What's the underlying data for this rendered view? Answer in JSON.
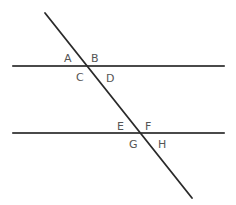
{
  "diagram": {
    "colors": {
      "stroke": "#2a2a2a",
      "label": "#555555",
      "background": "#ffffff"
    },
    "parallel_lines": [
      {
        "name": "upper-parallel-line",
        "x1": 13,
        "y1": 66,
        "x2": 224,
        "y2": 66
      },
      {
        "name": "lower-parallel-line",
        "x1": 13,
        "y1": 133,
        "x2": 224,
        "y2": 133
      }
    ],
    "transversal": {
      "x1": 45,
      "y1": 13,
      "x2": 192,
      "y2": 198
    },
    "intersections": [
      {
        "x": 88,
        "y": 66
      },
      {
        "x": 142,
        "y": 133
      }
    ],
    "angle_labels": [
      {
        "text": "A",
        "x": 64,
        "y": 62
      },
      {
        "text": "B",
        "x": 91,
        "y": 62
      },
      {
        "text": "C",
        "x": 76,
        "y": 81
      },
      {
        "text": "D",
        "x": 106,
        "y": 82
      },
      {
        "text": "E",
        "x": 117,
        "y": 130
      },
      {
        "text": "F",
        "x": 145,
        "y": 130
      },
      {
        "text": "G",
        "x": 129,
        "y": 148
      },
      {
        "text": "H",
        "x": 158,
        "y": 148
      }
    ]
  }
}
